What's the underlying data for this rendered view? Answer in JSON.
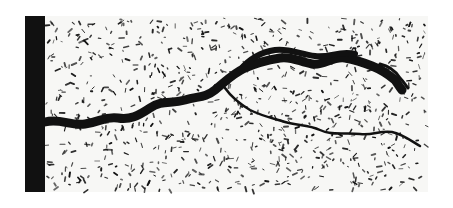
{
  "image": {
    "description": "Black-and-white metallographic micrograph showing a crack propagating from a dark left edge through a speckled microstructure",
    "width": 453,
    "height": 208,
    "colors": {
      "background": "#ffffff",
      "field": "#f7f7f5",
      "ink": "#111111"
    },
    "edge_bar": {
      "x": 25,
      "y": 16,
      "width": 20,
      "height": 176
    },
    "field_area": {
      "x": 45,
      "y": 16,
      "width": 383,
      "height": 176
    },
    "crack": {
      "main_path": "M45,122 C60,118 70,126 85,124 C100,122 105,116 118,118 C130,120 138,116 150,108 C162,100 170,104 185,100 C198,96 205,98 215,90 C225,82 232,74 245,68 C258,62 268,60 280,58 C292,56 300,62 312,64 C324,66 332,56 345,58 C356,60 362,62 372,66 C382,70 388,74 395,80 C398,84 400,88 402,90",
      "main_width": 9,
      "upper_branch": "M240,70 C250,58 262,52 275,50 C288,48 300,54 315,56 C330,58 340,50 355,54",
      "upper_width": 6,
      "lower_branch": "M225,88 C232,98 240,104 250,110 C262,116 272,118 285,122 C298,126 308,124 320,130 C332,136 345,132 360,134 C372,136 380,130 392,132 C402,134 410,140 420,146",
      "lower_width": 2.5,
      "tail_branch": "M380,64 C390,66 396,72 400,78 C404,82 406,86 408,88",
      "tail_width": 3
    },
    "speckles": {
      "count": 900,
      "seed": 7
    }
  }
}
